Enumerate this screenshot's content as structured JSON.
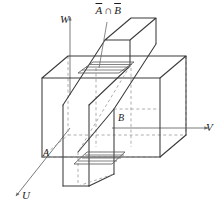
{
  "figure": {
    "axes": [
      {
        "id": "w",
        "label": "W",
        "direction": "up"
      },
      {
        "id": "v",
        "label": "V",
        "direction": "right"
      },
      {
        "id": "u",
        "label": "U",
        "direction": "down-left"
      }
    ],
    "points": [
      {
        "id": "a",
        "label": "A"
      },
      {
        "id": "b",
        "label": "B"
      }
    ],
    "set_label": {
      "first": "A",
      "operator": "∩",
      "second": "B",
      "full": "Ā ∩ B̄"
    },
    "colors": {
      "background": "#ffffff",
      "solid_line": "#3a3a3a",
      "hidden_line": "#9a9a9a",
      "axis_line": "#6b6b6b",
      "hatch_line": "#5a5a5a",
      "label_text": "#1a1a1a"
    },
    "geometry": {
      "cube": {
        "front_bottom_left": [
          42,
          157
        ],
        "front_bottom_right": [
          160,
          157
        ],
        "front_top_left": [
          42,
          78
        ],
        "front_top_right": [
          160,
          78
        ],
        "back_offset": [
          26,
          -22
        ]
      },
      "slab": {
        "description": "diagonal rectangular prism passing through the cube"
      }
    }
  }
}
